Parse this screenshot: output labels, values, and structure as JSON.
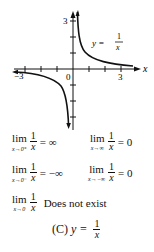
{
  "graph": {
    "function_label": {
      "lhs": "y =",
      "num": "1",
      "den": "x"
    },
    "x_axis_label": "x",
    "origin_label": "0",
    "tick_labels": {
      "x_neg": "−3",
      "x_pos": "3",
      "y_pos": "3"
    }
  },
  "limits": [
    {
      "sub": "x→0⁺",
      "num": "1",
      "den": "x",
      "result": "= ∞"
    },
    {
      "sub": "x→∞",
      "num": "1",
      "den": "x",
      "result": "= 0"
    },
    {
      "sub": "x→0⁻",
      "num": "1",
      "den": "x",
      "result": "= −∞"
    },
    {
      "sub": "x→−∞",
      "num": "1",
      "den": "x",
      "result": "= 0"
    },
    {
      "sub": "x→0",
      "num": "1",
      "den": "x",
      "result": "Does not exist"
    }
  ],
  "lim_word": "lim",
  "caption": {
    "label": "(C)",
    "lhs": "y =",
    "num": "1",
    "den": "x"
  }
}
